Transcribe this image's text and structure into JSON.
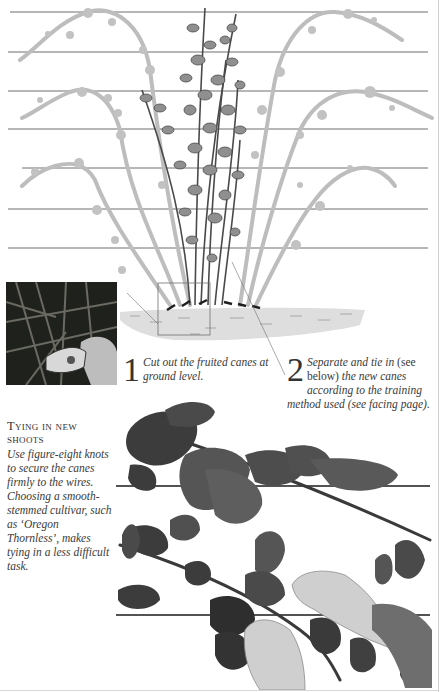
{
  "illustration": {
    "title": "Pruning and training blackberry canes",
    "wire_count": 7,
    "colors": {
      "wire": "#6e6e6e",
      "old_cane": "#bdbdbd",
      "new_cane": "#4a4a4a",
      "soil": "#dcdcdc",
      "photo_dark": "#1d1f1a"
    }
  },
  "steps": [
    {
      "number": "1",
      "text": "Cut out the fruited canes at ground level."
    },
    {
      "number": "2",
      "text_part1": "Separate and tie in",
      "text_roman": " (see below) ",
      "text_part2": "the new canes according to the training method used (see facing page)."
    }
  ],
  "sidebar": {
    "title": "Tying in new shoots",
    "body": "Use figure-eight knots to secure the canes firmly to the wires. Choosing a smooth-stemmed cultivar, such as ‘Oregon Thornless’, makes tying in a less difficult task."
  },
  "photos": {
    "inset": "secateurs-cutting-cane-photo",
    "bottom": "hands-tying-cane-to-wire-photo"
  }
}
